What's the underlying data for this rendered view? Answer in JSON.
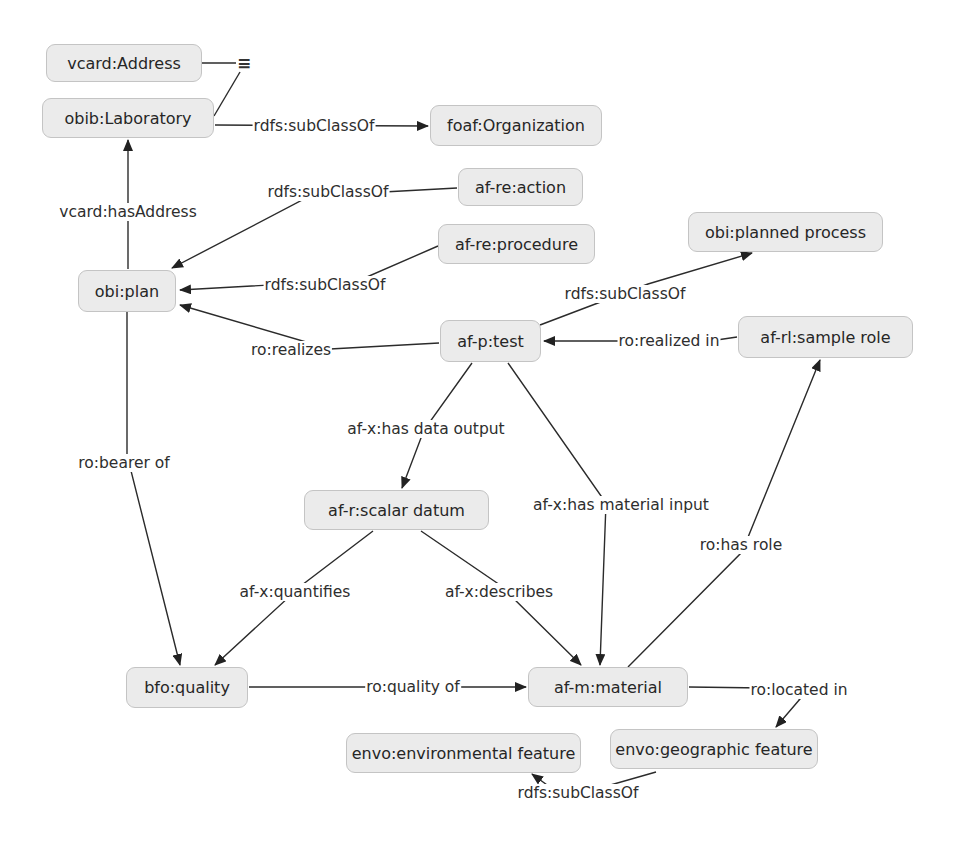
{
  "diagram": {
    "type": "ontology-concept-map",
    "nodes": [
      {
        "id": "vcard_address",
        "label": "vcard:Address",
        "x": 46,
        "y": 44,
        "w": 156,
        "h": 38
      },
      {
        "id": "obib_laboratory",
        "label": "obib:Laboratory",
        "x": 42,
        "y": 98,
        "w": 172,
        "h": 40
      },
      {
        "id": "foaf_organization",
        "label": "foaf:Organization",
        "x": 430,
        "y": 105,
        "w": 172,
        "h": 41
      },
      {
        "id": "afre_action",
        "label": "af-re:action",
        "x": 458,
        "y": 168,
        "w": 125,
        "h": 38
      },
      {
        "id": "afre_procedure",
        "label": "af-re:procedure",
        "x": 438,
        "y": 224,
        "w": 157,
        "h": 40
      },
      {
        "id": "obi_planned_process",
        "label": "obi:planned process",
        "x": 688,
        "y": 212,
        "w": 195,
        "h": 40
      },
      {
        "id": "obi_plan",
        "label": "obi:plan",
        "x": 78,
        "y": 270,
        "w": 98,
        "h": 42
      },
      {
        "id": "afp_test",
        "label": "af-p:test",
        "x": 440,
        "y": 320,
        "w": 101,
        "h": 42
      },
      {
        "id": "afrl_sample_role",
        "label": "af-rl:sample role",
        "x": 738,
        "y": 316,
        "w": 175,
        "h": 42
      },
      {
        "id": "afr_scalar_datum",
        "label": "af-r:scalar datum",
        "x": 304,
        "y": 490,
        "w": 185,
        "h": 40
      },
      {
        "id": "bfo_quality",
        "label": "bfo:quality",
        "x": 126,
        "y": 667,
        "w": 122,
        "h": 41
      },
      {
        "id": "afm_material",
        "label": "af-m:material",
        "x": 528,
        "y": 667,
        "w": 160,
        "h": 40
      },
      {
        "id": "envo_environmental_feature",
        "label": "envo:environmental feature",
        "x": 346,
        "y": 733,
        "w": 235,
        "h": 40
      },
      {
        "id": "envo_geographic_feature",
        "label": "envo:geographic feature",
        "x": 610,
        "y": 729,
        "w": 208,
        "h": 40
      }
    ],
    "equivalence_symbol": {
      "label": "≡",
      "x": 244,
      "y": 63
    },
    "edges": [
      {
        "label": "",
        "path": "M202,63 L236,63",
        "arrow": false
      },
      {
        "label": "",
        "path": "M214,116 L240,72",
        "arrow": false
      },
      {
        "label": "rdfs:subClassOf",
        "lx": 314,
        "ly": 126,
        "path": "M215,125 L428,126",
        "arrow": true
      },
      {
        "label": "vcard:hasAddress",
        "lx": 128,
        "ly": 212,
        "path": "M128,269 L128,140",
        "arrow": true
      },
      {
        "label": "rdfs:subClassOf",
        "lx": 328,
        "ly": 192,
        "path": "M457,188 L310,196 L172,268",
        "arrow": true
      },
      {
        "label": "rdfs:subClassOf",
        "lx": 325,
        "ly": 285,
        "path": "M438,246 L360,280 L180,290",
        "arrow": true
      },
      {
        "label": "rdfs:subClassOf",
        "lx": 625,
        "ly": 294,
        "path": "M540,325 L648,284 L752,253",
        "arrow": true
      },
      {
        "label": "ro:realizes",
        "lx": 291,
        "ly": 350,
        "path": "M439,343 L330,349 L180,305",
        "arrow": true
      },
      {
        "label": "ro:realized in",
        "lx": 669,
        "ly": 341,
        "path": "M737,337 L710,341 L544,341",
        "arrow": true
      },
      {
        "label": "af-x:has data output",
        "lx": 426,
        "ly": 429,
        "path": "M472,363 L424,430 L402,488",
        "arrow": true
      },
      {
        "label": "af-x:has material input",
        "lx": 621,
        "ly": 505,
        "path": "M508,363 L606,503 L600,665",
        "arrow": true
      },
      {
        "label": "ro:has role",
        "lx": 741,
        "ly": 545,
        "path": "M628,667 L742,552 L820,360",
        "arrow": true
      },
      {
        "label": "ro:bearer of",
        "lx": 124,
        "ly": 463,
        "path": "M127,312 L127,455 L180,665",
        "arrow": true
      },
      {
        "label": "af-x:quantifies",
        "lx": 295,
        "ly": 592,
        "path": "M373,531 L302,585 L215,665",
        "arrow": true
      },
      {
        "label": "af-x:describes",
        "lx": 499,
        "ly": 592,
        "path": "M421,531 L500,585 L581,665",
        "arrow": true
      },
      {
        "label": "ro:quality of",
        "lx": 413,
        "ly": 687,
        "path": "M249,687 L440,687 L526,687",
        "arrow": true
      },
      {
        "label": "ro:located in",
        "lx": 799,
        "ly": 690,
        "path": "M689,687 L770,688 L800,699 L776,727",
        "arrow": true
      },
      {
        "label": "rdfs:subClassOf",
        "lx": 578,
        "ly": 793,
        "path": "M656,772 L565,798 L532,774",
        "arrow": true
      }
    ]
  }
}
